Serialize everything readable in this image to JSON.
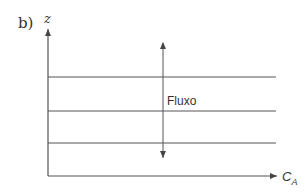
{
  "panel_label": "b)",
  "axes": {
    "y_label": "z",
    "x_label_main": "C",
    "x_label_sub": "A"
  },
  "flow_label": "Fluxo",
  "horizontal_lines": 3,
  "colors": {
    "stroke": "#444444",
    "text": "#333333",
    "background": "#ffffff"
  }
}
